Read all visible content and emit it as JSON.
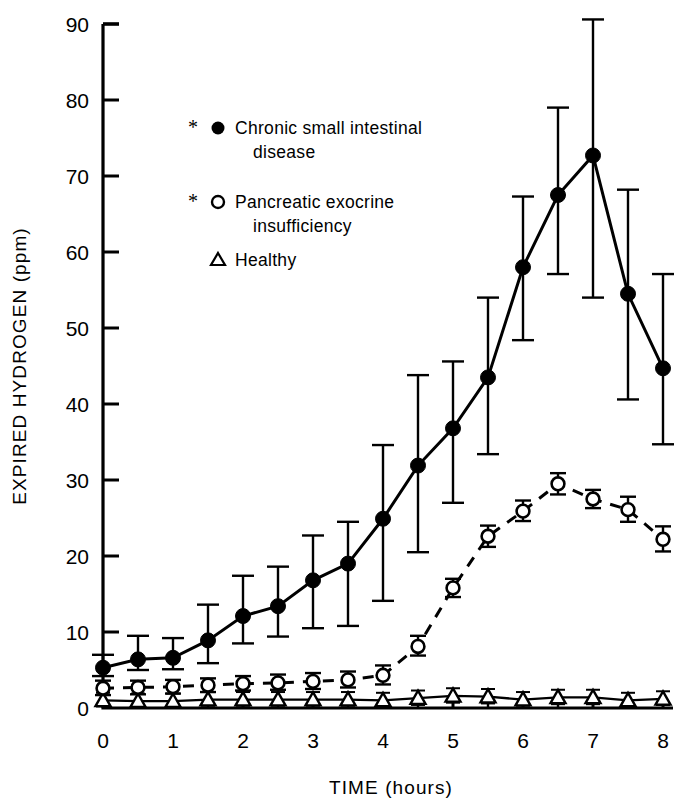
{
  "figure": {
    "background": "#ffffff",
    "ink": "#000000"
  },
  "axes": {
    "y_title": "EXPIRED  HYDROGEN  (ppm)",
    "x_title": "TIME (hours)",
    "y_ticks": [
      "0",
      "10",
      "20",
      "30",
      "40",
      "50",
      "60",
      "70",
      "80",
      "90"
    ],
    "x_ticks": [
      "0",
      "1",
      "2",
      "3",
      "4",
      "5",
      "6",
      "7",
      "8"
    ]
  },
  "legend": {
    "items": [
      {
        "marker": "filled-circle",
        "star": "*",
        "line1": "Chronic small intestinal",
        "line2": "disease"
      },
      {
        "marker": "open-circle",
        "star": "*",
        "line1": "Pancreatic  exocrine",
        "line2": "insufficiency"
      },
      {
        "marker": "open-triangle",
        "star": "",
        "line1": "Healthy",
        "line2": ""
      }
    ]
  },
  "chart_data": {
    "type": "line",
    "title": "",
    "xlabel": "TIME (hours)",
    "ylabel": "EXPIRED HYDROGEN (ppm)",
    "xlim": [
      0,
      8
    ],
    "ylim": [
      0,
      90
    ],
    "xticks": [
      0,
      1,
      2,
      3,
      4,
      5,
      6,
      7,
      8
    ],
    "yticks": [
      0,
      10,
      20,
      30,
      40,
      50,
      60,
      70,
      80,
      90
    ],
    "minor_xticks": [
      0.5,
      1.5,
      2.5,
      3.5,
      4.5,
      5.5,
      6.5,
      7.5
    ],
    "grid": false,
    "legend_position": "upper-left-inside",
    "errorbars": "mean +/- SEM",
    "x": [
      0,
      0.5,
      1,
      1.5,
      2,
      2.5,
      3,
      3.5,
      4,
      4.5,
      5,
      5.5,
      6,
      6.5,
      7,
      7.5,
      8
    ],
    "series": [
      {
        "name": "Chronic small intestinal disease",
        "marker": "filled-circle",
        "linestyle": "solid",
        "significance": "*",
        "values": [
          5.3,
          6.4,
          6.6,
          8.9,
          12.1,
          13.4,
          16.8,
          19.0,
          24.9,
          31.9,
          36.8,
          43.5,
          58.0,
          67.5,
          72.7,
          54.5,
          44.7
        ],
        "err_upper": [
          7.0,
          9.5,
          9.2,
          13.6,
          17.4,
          18.6,
          22.7,
          24.5,
          34.6,
          43.8,
          45.6,
          54.0,
          67.3,
          79.0,
          90.6,
          68.2,
          57.1
        ],
        "err_lower": [
          4.2,
          5.0,
          5.1,
          5.9,
          8.5,
          9.4,
          10.5,
          10.8,
          14.1,
          20.5,
          27.0,
          33.4,
          48.4,
          57.1,
          54.0,
          40.6,
          34.7
        ]
      },
      {
        "name": "Pancreatic exocrine insufficiency",
        "marker": "open-circle",
        "linestyle": "dashed",
        "significance": "*",
        "values": [
          2.6,
          2.7,
          2.8,
          3.0,
          3.2,
          3.3,
          3.5,
          3.7,
          4.3,
          8.1,
          15.8,
          22.6,
          25.9,
          29.5,
          27.5,
          26.1,
          22.2
        ],
        "err_upper": [
          3.6,
          3.6,
          3.7,
          3.9,
          4.2,
          4.4,
          4.6,
          4.8,
          5.6,
          9.5,
          17.0,
          24.0,
          27.3,
          30.9,
          28.7,
          27.8,
          23.9
        ],
        "err_lower": [
          1.7,
          1.8,
          1.9,
          2.1,
          2.3,
          2.4,
          2.5,
          2.7,
          3.1,
          6.9,
          14.6,
          21.2,
          24.6,
          28.1,
          26.3,
          24.5,
          20.6
        ]
      },
      {
        "name": "Healthy",
        "marker": "open-triangle",
        "linestyle": "solid",
        "significance": "",
        "values": [
          1.0,
          0.9,
          0.9,
          1.1,
          1.1,
          1.1,
          1.1,
          1.1,
          1.0,
          1.3,
          1.6,
          1.5,
          1.1,
          1.4,
          1.4,
          1.0,
          1.2
        ],
        "err_upper": [
          2.0,
          1.9,
          1.9,
          2.1,
          2.1,
          2.1,
          2.1,
          2.1,
          2.0,
          2.3,
          2.6,
          2.5,
          2.1,
          2.4,
          2.4,
          2.0,
          2.2
        ],
        "err_lower": [
          0.2,
          0.2,
          0.2,
          0.3,
          0.3,
          0.3,
          0.3,
          0.3,
          0.2,
          0.4,
          0.7,
          0.6,
          0.3,
          0.5,
          0.5,
          0.2,
          0.4
        ]
      }
    ]
  }
}
